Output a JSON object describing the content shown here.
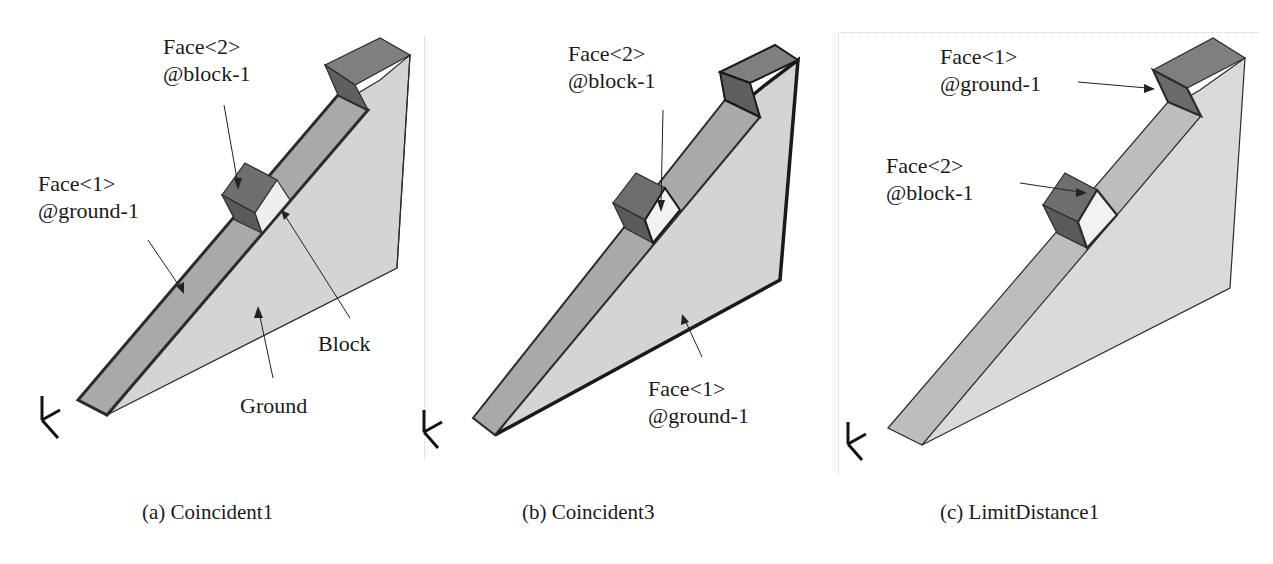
{
  "figure": {
    "panels": [
      {
        "id": "a",
        "caption": "(a) Coincident1",
        "labels": {
          "face2_line1": "Face<2>",
          "face2_line2": "@block-1",
          "face1_line1": "Face<1>",
          "face1_line2": "@ground-1",
          "block": "Block",
          "ground": "Ground"
        }
      },
      {
        "id": "b",
        "caption": "(b) Coincident3",
        "labels": {
          "face2_line1": "Face<2>",
          "face2_line2": "@block-1",
          "face1_line1": "Face<1>",
          "face1_line2": "@ground-1"
        }
      },
      {
        "id": "c",
        "caption": "(c) LimitDistance1",
        "labels": {
          "face1_line1": "Face<1>",
          "face1_line2": "@ground-1",
          "face2_line1": "Face<2>",
          "face2_line2": "@block-1"
        }
      }
    ],
    "triad_axes": [
      "Y",
      "X",
      "Z"
    ],
    "colors": {
      "ramp_top": "#a9a9a9",
      "ground_side": "#d4d4d4",
      "block": "#6e6e6e",
      "top_cap": "#7f7f7f",
      "edge": "#2b2b2b",
      "highlight_edge": "#1a1a1a"
    }
  }
}
